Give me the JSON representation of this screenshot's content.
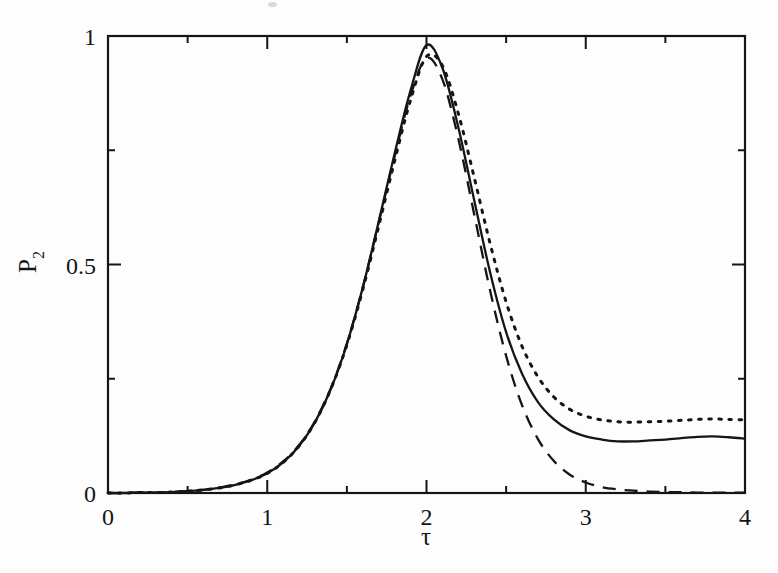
{
  "figure": {
    "background_color": "#fdfdfd",
    "ink_color": "#151515",
    "frame": {
      "left_px": 108,
      "right_px": 745,
      "top_px": 36,
      "bottom_px": 493
    }
  },
  "axes": {
    "x": {
      "label": "τ",
      "label_name": "tau",
      "min": 0,
      "max": 4,
      "major_ticks": [
        0,
        1,
        2,
        3,
        4
      ],
      "major_tick_labels": [
        "0",
        "1",
        "2",
        "3",
        "4"
      ],
      "minor_ticks": [
        0.5,
        1.5,
        2.5,
        3.5
      ]
    },
    "y": {
      "label": "P₂",
      "label_base": "P",
      "label_sub": "2",
      "min": 0,
      "max": 1,
      "major_ticks": [
        0,
        0.5,
        1
      ],
      "major_tick_labels": [
        "0",
        "0.5",
        "1"
      ],
      "minor_ticks": [
        0.25,
        0.75
      ]
    }
  },
  "chart_data": {
    "type": "line",
    "title": "",
    "subtitle": "",
    "xlabel": "τ",
    "ylabel": "P₂",
    "xlim": [
      0,
      4
    ],
    "ylim": [
      0,
      1
    ],
    "grid": false,
    "legend": "none",
    "annotations": [],
    "x": [
      0,
      0.1,
      0.2,
      0.3,
      0.4,
      0.5,
      0.6,
      0.7,
      0.8,
      0.9,
      1.0,
      1.1,
      1.2,
      1.3,
      1.4,
      1.5,
      1.6,
      1.7,
      1.8,
      1.9,
      2.0,
      2.1,
      2.2,
      2.3,
      2.4,
      2.5,
      2.6,
      2.7,
      2.8,
      2.9,
      3.0,
      3.1,
      3.2,
      3.3,
      3.4,
      3.5,
      3.6,
      3.7,
      3.8,
      3.9,
      4.0
    ],
    "series": [
      {
        "name": "solid-curve",
        "style": "solid",
        "color": "#151515",
        "values": [
          0.0,
          0.0,
          0.001,
          0.001,
          0.002,
          0.004,
          0.007,
          0.011,
          0.018,
          0.028,
          0.043,
          0.067,
          0.103,
          0.155,
          0.228,
          0.326,
          0.45,
          0.594,
          0.743,
          0.881,
          0.98,
          0.93,
          0.8,
          0.64,
          0.482,
          0.352,
          0.261,
          0.199,
          0.161,
          0.137,
          0.124,
          0.117,
          0.113,
          0.113,
          0.115,
          0.117,
          0.12,
          0.123,
          0.124,
          0.122,
          0.119
        ]
      },
      {
        "name": "dashed-curve",
        "style": "dashed",
        "color": "#151515",
        "values": [
          0.0,
          0.0,
          0.001,
          0.001,
          0.002,
          0.004,
          0.007,
          0.012,
          0.019,
          0.029,
          0.045,
          0.069,
          0.105,
          0.157,
          0.23,
          0.327,
          0.45,
          0.592,
          0.737,
          0.87,
          0.952,
          0.905,
          0.775,
          0.609,
          0.442,
          0.3,
          0.192,
          0.118,
          0.07,
          0.04,
          0.023,
          0.013,
          0.008,
          0.005,
          0.003,
          0.002,
          0.002,
          0.001,
          0.001,
          0.001,
          0.001
        ]
      },
      {
        "name": "dotted-curve",
        "style": "dotted",
        "color": "#151515",
        "values": [
          0.0,
          0.0,
          0.001,
          0.001,
          0.002,
          0.004,
          0.007,
          0.011,
          0.018,
          0.028,
          0.043,
          0.067,
          0.103,
          0.155,
          0.228,
          0.324,
          0.445,
          0.584,
          0.727,
          0.86,
          0.955,
          0.935,
          0.83,
          0.69,
          0.545,
          0.418,
          0.321,
          0.254,
          0.21,
          0.183,
          0.168,
          0.16,
          0.156,
          0.155,
          0.156,
          0.157,
          0.159,
          0.161,
          0.162,
          0.161,
          0.16
        ]
      }
    ]
  }
}
